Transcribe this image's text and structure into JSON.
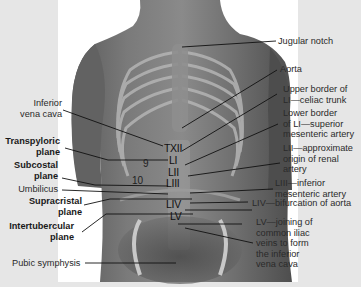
{
  "figure": {
    "colors": {
      "page_background": "#e6e6e6",
      "photo_background": "#ffffff",
      "skin": "#6e6e6e",
      "leader_line": "#111111",
      "label_text": "#2a2a2a"
    }
  },
  "left_labels": [
    {
      "id": "inferior-vena-cava",
      "lines": [
        "Inferior",
        "vena cava"
      ],
      "bold": false
    },
    {
      "id": "transpyloric-plane",
      "lines": [
        "Transpyloric",
        "plane"
      ],
      "bold": true
    },
    {
      "id": "subcostal-plane",
      "lines": [
        "Subcostal",
        "plane"
      ],
      "bold": true
    },
    {
      "id": "umbilicus",
      "lines": [
        "Umbilicus"
      ],
      "bold": false
    },
    {
      "id": "supracristal-plane",
      "lines": [
        "Supracristal",
        "plane"
      ],
      "bold": true
    },
    {
      "id": "intertubercular-plane",
      "lines": [
        "Intertubercular",
        "plane"
      ],
      "bold": true
    },
    {
      "id": "pubic-symphysis",
      "lines": [
        "Pubic symphysis"
      ],
      "bold": false
    }
  ],
  "right_labels": [
    {
      "id": "jugular-notch",
      "lines": [
        "Jugular notch"
      ]
    },
    {
      "id": "aorta",
      "lines": [
        "Aorta"
      ]
    },
    {
      "id": "celiac-trunk",
      "lines": [
        "Upper border of",
        "LI—celiac trunk"
      ]
    },
    {
      "id": "superior-mesenteric",
      "lines": [
        "Lower border",
        "of LI—superior",
        "mesenteric artery"
      ]
    },
    {
      "id": "renal-artery",
      "lines": [
        "LII—approximate",
        "origin of renal",
        "artery"
      ]
    },
    {
      "id": "inferior-mesenteric",
      "lines": [
        "LIII—inferior",
        "mesenteric artery"
      ]
    },
    {
      "id": "aortic-bifurcation",
      "lines": [
        "LIV—bifurcation of aorta"
      ]
    },
    {
      "id": "common-iliac-veins",
      "lines": [
        "LV—joining of",
        "common iliac",
        "veins to form",
        "the inferior",
        "vena cava"
      ]
    }
  ],
  "vertebral_levels": [
    "TXII",
    "LI",
    "LII",
    "LIII",
    "LIV",
    "LV"
  ],
  "rib_numbers": [
    "9",
    "10"
  ]
}
